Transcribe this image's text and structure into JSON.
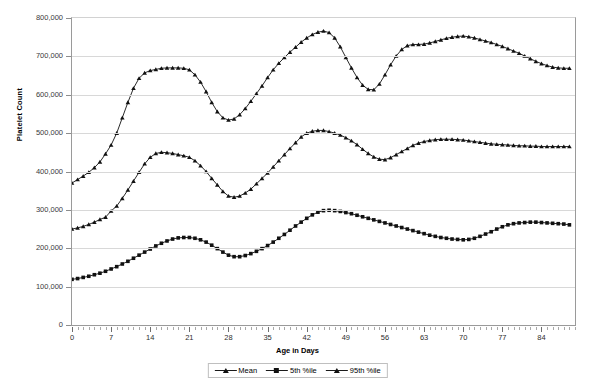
{
  "chart_data": {
    "type": "line",
    "title": "",
    "xlabel": "Age in Days",
    "ylabel": "Platelet Count",
    "xlim": [
      0,
      90
    ],
    "ylim": [
      0,
      800000
    ],
    "ytick_labels": [
      "800,000",
      "700,000",
      "600,000",
      "500,000",
      "400,000",
      "300,000",
      "200,000",
      "100,000",
      "0"
    ],
    "ytick_values": [
      800000,
      700000,
      600000,
      500000,
      400000,
      300000,
      200000,
      100000,
      0
    ],
    "xtick_labels": [
      "0",
      "7",
      "14",
      "21",
      "28",
      "35",
      "42",
      "49",
      "56",
      "63",
      "70",
      "77",
      "84"
    ],
    "xtick_values": [
      0,
      7,
      14,
      21,
      28,
      35,
      42,
      49,
      56,
      63,
      70,
      77,
      84
    ],
    "xtick_minor_step": 1,
    "grid": "horizontal",
    "legend_position": "bottom",
    "line_color": "#111111",
    "grid_color": "#d8d8d8",
    "axis_color": "#9a9a9a",
    "series": [
      {
        "name": "Mean",
        "marker": "triangle",
        "x": [
          0,
          1,
          2,
          3,
          4,
          5,
          6,
          7,
          8,
          9,
          10,
          11,
          12,
          13,
          14,
          15,
          16,
          17,
          18,
          19,
          20,
          21,
          22,
          23,
          24,
          25,
          26,
          27,
          28,
          29,
          30,
          31,
          32,
          33,
          34,
          35,
          36,
          37,
          38,
          39,
          40,
          41,
          42,
          43,
          44,
          45,
          46,
          47,
          48,
          49,
          50,
          51,
          52,
          53,
          54,
          55,
          56,
          57,
          58,
          59,
          60,
          61,
          62,
          63,
          64,
          65,
          66,
          67,
          68,
          69,
          70,
          71,
          72,
          73,
          74,
          75,
          76,
          77,
          78,
          79,
          80,
          81,
          82,
          83,
          84,
          85,
          86,
          87,
          88,
          89
        ],
        "values": [
          250000,
          253000,
          257000,
          262000,
          268000,
          275000,
          281000,
          297000,
          310000,
          330000,
          352000,
          375000,
          398000,
          420000,
          437000,
          447000,
          450000,
          449000,
          447000,
          444000,
          441000,
          437000,
          428000,
          415000,
          400000,
          382000,
          365000,
          348000,
          336000,
          333000,
          336000,
          344000,
          354000,
          368000,
          382000,
          396000,
          412000,
          428000,
          444000,
          460000,
          475000,
          490000,
          500000,
          505000,
          507000,
          507000,
          504000,
          500000,
          495000,
          488000,
          480000,
          470000,
          458000,
          447000,
          438000,
          432000,
          431000,
          436000,
          444000,
          452000,
          460000,
          468000,
          474000,
          478000,
          481000,
          483000,
          484000,
          484000,
          484000,
          483000,
          482000,
          480000,
          478000,
          476000,
          474000,
          472000,
          471000,
          470000,
          469000,
          468000,
          467000,
          467000,
          466000,
          466000,
          465000,
          465000,
          465000,
          465000,
          465000,
          465000
        ]
      },
      {
        "name": "5th %ile",
        "marker": "square",
        "x": [
          0,
          1,
          2,
          3,
          4,
          5,
          6,
          7,
          8,
          9,
          10,
          11,
          12,
          13,
          14,
          15,
          16,
          17,
          18,
          19,
          20,
          21,
          22,
          23,
          24,
          25,
          26,
          27,
          28,
          29,
          30,
          31,
          32,
          33,
          34,
          35,
          36,
          37,
          38,
          39,
          40,
          41,
          42,
          43,
          44,
          45,
          46,
          47,
          48,
          49,
          50,
          51,
          52,
          53,
          54,
          55,
          56,
          57,
          58,
          59,
          60,
          61,
          62,
          63,
          64,
          65,
          66,
          67,
          68,
          69,
          70,
          71,
          72,
          73,
          74,
          75,
          76,
          77,
          78,
          79,
          80,
          81,
          82,
          83,
          84,
          85,
          86,
          87,
          88,
          89
        ],
        "values": [
          119000,
          121000,
          124000,
          127000,
          131000,
          135000,
          140000,
          146000,
          152000,
          159000,
          166000,
          174000,
          182000,
          190000,
          198000,
          206000,
          213000,
          219000,
          224000,
          227000,
          228000,
          228000,
          226000,
          222000,
          216000,
          208000,
          199000,
          190000,
          182000,
          178000,
          178000,
          181000,
          186000,
          192000,
          199000,
          207000,
          216000,
          226000,
          236000,
          247000,
          258000,
          268000,
          278000,
          287000,
          294000,
          298000,
          299000,
          298000,
          296000,
          293000,
          290000,
          286000,
          282000,
          278000,
          274000,
          270000,
          266000,
          262000,
          258000,
          254000,
          250000,
          246000,
          242000,
          238000,
          234000,
          231000,
          228000,
          226000,
          224000,
          223000,
          222000,
          223000,
          226000,
          231000,
          237000,
          243000,
          250000,
          256000,
          261000,
          264000,
          266000,
          267000,
          268000,
          268000,
          267000,
          266000,
          265000,
          264000,
          263000,
          261000
        ]
      },
      {
        "name": "95th %ile",
        "marker": "triangle",
        "x": [
          0,
          1,
          2,
          3,
          4,
          5,
          6,
          7,
          8,
          9,
          10,
          11,
          12,
          13,
          14,
          15,
          16,
          17,
          18,
          19,
          20,
          21,
          22,
          23,
          24,
          25,
          26,
          27,
          28,
          29,
          30,
          31,
          32,
          33,
          34,
          35,
          36,
          37,
          38,
          39,
          40,
          41,
          42,
          43,
          44,
          45,
          46,
          47,
          48,
          49,
          50,
          51,
          52,
          53,
          54,
          55,
          56,
          57,
          58,
          59,
          60,
          61,
          62,
          63,
          64,
          65,
          66,
          67,
          68,
          69,
          70,
          71,
          72,
          73,
          74,
          75,
          76,
          77,
          78,
          79,
          80,
          81,
          82,
          83,
          84,
          85,
          86,
          87,
          88,
          89
        ],
        "values": [
          370000,
          379000,
          388000,
          398000,
          410000,
          425000,
          446000,
          469000,
          500000,
          540000,
          580000,
          617000,
          643000,
          657000,
          663000,
          666000,
          669000,
          670000,
          670000,
          670000,
          669000,
          665000,
          652000,
          633000,
          608000,
          580000,
          556000,
          540000,
          534000,
          537000,
          548000,
          564000,
          583000,
          603000,
          623000,
          645000,
          665000,
          682000,
          697000,
          711000,
          724000,
          737000,
          748000,
          757000,
          763000,
          766000,
          762000,
          748000,
          725000,
          697000,
          670000,
          645000,
          625000,
          614000,
          613000,
          628000,
          652000,
          678000,
          701000,
          718000,
          728000,
          731000,
          731000,
          732000,
          735000,
          739000,
          743000,
          747000,
          750000,
          752000,
          753000,
          751000,
          748000,
          744000,
          740000,
          736000,
          731000,
          726000,
          720000,
          714000,
          708000,
          701000,
          694000,
          687000,
          681000,
          676000,
          672000,
          670000,
          669000,
          669000
        ]
      }
    ]
  }
}
